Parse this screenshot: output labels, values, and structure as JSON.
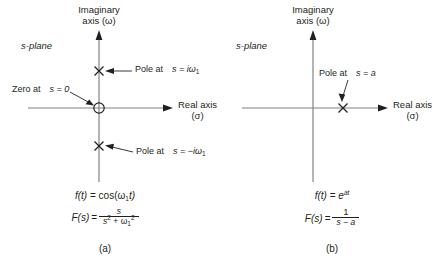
{
  "figure": {
    "panels": [
      {
        "caption": "(a)",
        "plane_label": "s-plane",
        "imaginary_axis_label_line1": "Imaginary",
        "imaginary_axis_label_line2": "axis (ω)",
        "real_axis_label_line1": "Real axis",
        "real_axis_label_line2": "(σ)",
        "annotations": [
          {
            "name": "pole-upper",
            "text_prefix": "Pole at",
            "text_expr": "s = iω",
            "subscript": "1",
            "marker": "x-marker"
          },
          {
            "name": "zero-origin",
            "text_prefix": "Zero at",
            "text_expr": "s = 0",
            "subscript": "",
            "marker": "circle-marker"
          },
          {
            "name": "pole-lower",
            "text_prefix": "Pole at",
            "text_expr": "s = −iω",
            "subscript": "1",
            "marker": "x-marker"
          }
        ],
        "time_function": {
          "lhs": "f(t)",
          "eq": "=",
          "rhs": "cos(ω",
          "rhs_sub": "1",
          "rhs_tail": "t)"
        },
        "laplace_function": {
          "lhs": "F(s)",
          "eq": "=",
          "numerator": "s",
          "denominator_base": "s",
          "denominator_sup": "2",
          "denominator_plus": "+ ω",
          "denominator_sub": "1",
          "denominator_sup2": "2"
        }
      },
      {
        "caption": "(b)",
        "plane_label": "s-plane",
        "imaginary_axis_label_line1": "Imaginary",
        "imaginary_axis_label_line2": "axis (ω)",
        "real_axis_label_line1": "Real axis",
        "real_axis_label_line2": "(σ)",
        "annotations": [
          {
            "name": "pole-real",
            "text_prefix": "Pole at",
            "text_expr": "s = a",
            "subscript": "",
            "marker": "x-marker"
          }
        ],
        "time_function": {
          "lhs": "f(t)",
          "eq": "=",
          "rhs": "e",
          "rhs_sup": "at"
        },
        "laplace_function": {
          "lhs": "F(s)",
          "eq": "=",
          "numerator": "1",
          "denominator": "s − a"
        }
      }
    ],
    "colors": {
      "ink": "#231f20",
      "axis": "#808285",
      "background": "#ffffff"
    }
  }
}
